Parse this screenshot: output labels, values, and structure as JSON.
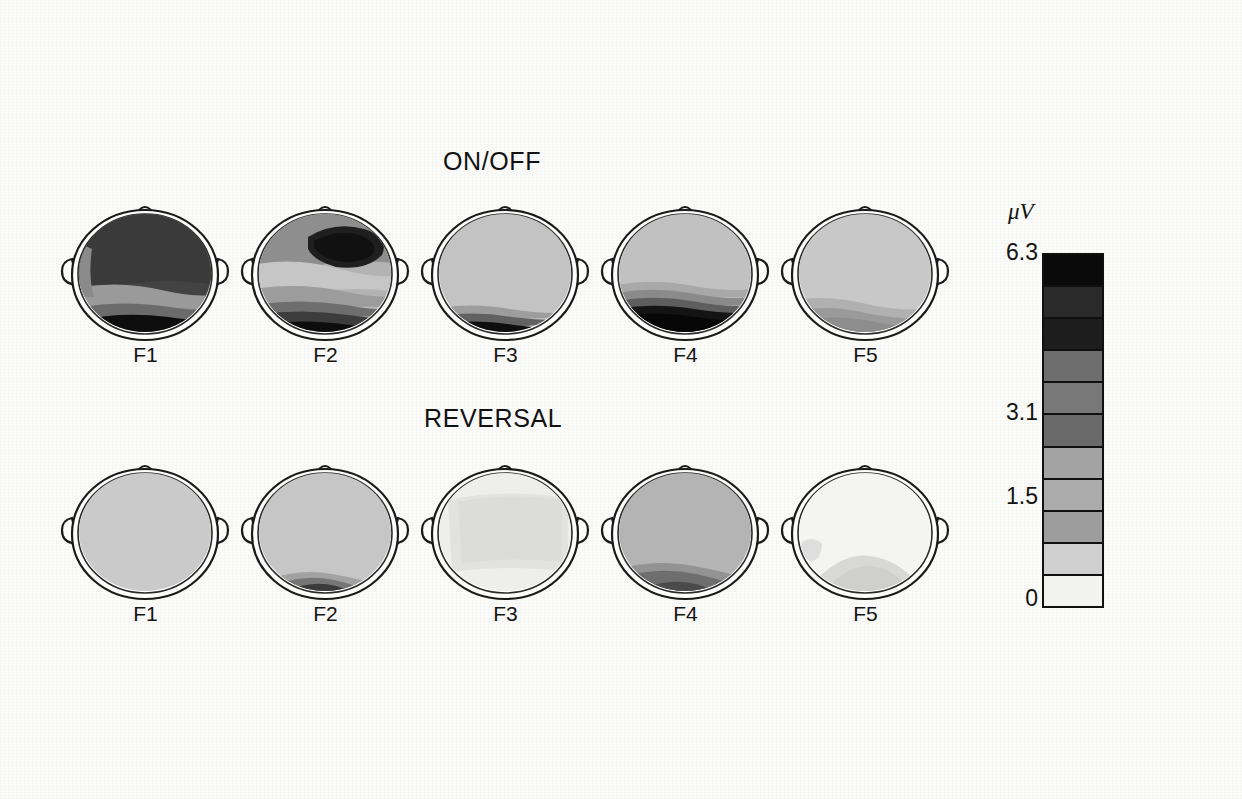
{
  "figure": {
    "background_color": "#fbfbfa",
    "row_titles": [
      {
        "id": "onoff",
        "label": "ON/OFF"
      },
      {
        "id": "reversal",
        "label": "REVERSAL"
      }
    ]
  },
  "colorbar": {
    "units_label": "μV",
    "ticks": [
      {
        "value": "6.3",
        "position_pct": 0
      },
      {
        "value": "3.1",
        "position_pct": 50
      },
      {
        "value": "1.5",
        "position_pct": 75
      },
      {
        "value": "0",
        "position_pct": 100
      }
    ],
    "max": 6.3,
    "min": 0,
    "band_count": 11,
    "band_colors": [
      "#0a0a0a",
      "#2a2a2a",
      "#1d1d1d",
      "#6e6e6e",
      "#787878",
      "#6a6a6a",
      "#a3a3a3",
      "#ababab",
      "#9d9d9d",
      "#cfcfcf",
      "#f2f2f0"
    ]
  },
  "chart_data": {
    "type": "heatmap",
    "subtitle": "ON/OFF and REVERSAL conditions, frequency components F1–F5",
    "units": "μV",
    "colorbar_ticks": [
      "6.3",
      "3.1",
      "1.5",
      "0"
    ],
    "value_range": [
      0,
      6.3
    ],
    "rows": [
      {
        "condition": "ON/OFF",
        "maps": [
          {
            "label": "F1",
            "description": "broad very-high amplitude over nearly entire scalp, darkest occipital band",
            "peak_uv": 6.3,
            "regions": [
              {
                "name": "frontal",
                "value": 5.2
              },
              {
                "name": "central",
                "value": 5.6
              },
              {
                "name": "parietal",
                "value": 4.4
              },
              {
                "name": "occipital",
                "value": 6.3
              },
              {
                "name": "left-temporal",
                "value": 2.6
              },
              {
                "name": "right-temporal",
                "value": 4.0
              }
            ]
          },
          {
            "label": "F2",
            "description": "focal dark maximum right-frontal, banded mid scalp, strong occipital band",
            "peak_uv": 6.3,
            "regions": [
              {
                "name": "frontal",
                "value": 3.0
              },
              {
                "name": "right-frontal-focus",
                "value": 6.0
              },
              {
                "name": "central",
                "value": 1.6
              },
              {
                "name": "parietal",
                "value": 2.4
              },
              {
                "name": "occipital",
                "value": 6.3
              },
              {
                "name": "left-temporal",
                "value": 1.4
              }
            ]
          },
          {
            "label": "F3",
            "description": "uniform low amplitude with narrow dark occipital rim",
            "peak_uv": 5.8,
            "regions": [
              {
                "name": "frontal",
                "value": 1.2
              },
              {
                "name": "central",
                "value": 1.2
              },
              {
                "name": "parietal",
                "value": 1.4
              },
              {
                "name": "occipital",
                "value": 5.8
              }
            ]
          },
          {
            "label": "F4",
            "description": "large graded occipital maximum extending to parietal",
            "peak_uv": 6.3,
            "regions": [
              {
                "name": "frontal",
                "value": 1.3
              },
              {
                "name": "central",
                "value": 1.4
              },
              {
                "name": "parietal",
                "value": 3.2
              },
              {
                "name": "occipital",
                "value": 6.3
              }
            ]
          },
          {
            "label": "F5",
            "description": "low amplitude overall with moderate occipital elevation",
            "peak_uv": 2.6,
            "regions": [
              {
                "name": "frontal",
                "value": 1.2
              },
              {
                "name": "central",
                "value": 1.3
              },
              {
                "name": "parietal",
                "value": 1.8
              },
              {
                "name": "occipital",
                "value": 2.6
              }
            ]
          }
        ]
      },
      {
        "condition": "REVERSAL",
        "maps": [
          {
            "label": "F1",
            "description": "flat uniform low amplitude across the scalp",
            "peak_uv": 1.4,
            "regions": [
              {
                "name": "frontal",
                "value": 1.3
              },
              {
                "name": "central",
                "value": 1.3
              },
              {
                "name": "parietal",
                "value": 1.3
              },
              {
                "name": "occipital",
                "value": 1.4
              }
            ]
          },
          {
            "label": "F2",
            "description": "low amplitude with small dark focus at occipital midline",
            "peak_uv": 4.6,
            "regions": [
              {
                "name": "frontal",
                "value": 1.3
              },
              {
                "name": "central",
                "value": 1.4
              },
              {
                "name": "parietal",
                "value": 1.6
              },
              {
                "name": "occipital-focus",
                "value": 4.6
              }
            ]
          },
          {
            "label": "F3",
            "description": "near-zero amplitude, faint light patch centrally",
            "peak_uv": 0.9,
            "regions": [
              {
                "name": "frontal",
                "value": 0.5
              },
              {
                "name": "central",
                "value": 0.8
              },
              {
                "name": "parietal",
                "value": 0.6
              },
              {
                "name": "occipital",
                "value": 0.5
              }
            ]
          },
          {
            "label": "F4",
            "description": "moderate background with darker occipital midline focus",
            "peak_uv": 4.2,
            "regions": [
              {
                "name": "frontal",
                "value": 1.7
              },
              {
                "name": "central",
                "value": 1.8
              },
              {
                "name": "parietal",
                "value": 2.2
              },
              {
                "name": "occipital-focus",
                "value": 4.2
              }
            ]
          },
          {
            "label": "F5",
            "description": "near-zero amplitude, faint occipital hump",
            "peak_uv": 1.1,
            "regions": [
              {
                "name": "frontal",
                "value": 0.3
              },
              {
                "name": "central",
                "value": 0.4
              },
              {
                "name": "parietal",
                "value": 0.7
              },
              {
                "name": "occipital",
                "value": 1.1
              }
            ]
          }
        ]
      }
    ]
  },
  "heads": {
    "onoff": [
      {
        "label": "F1",
        "x": 58,
        "y": 193
      },
      {
        "label": "F2",
        "x": 238,
        "y": 193
      },
      {
        "label": "F3",
        "x": 418,
        "y": 193
      },
      {
        "label": "F4",
        "x": 598,
        "y": 193
      },
      {
        "label": "F5",
        "x": 778,
        "y": 193
      }
    ],
    "reversal": [
      {
        "label": "F1",
        "x": 58,
        "y": 452
      },
      {
        "label": "F2",
        "x": 238,
        "y": 452
      },
      {
        "label": "F3",
        "x": 418,
        "y": 452
      },
      {
        "label": "F4",
        "x": 598,
        "y": 452
      },
      {
        "label": "F5",
        "x": 778,
        "y": 452
      }
    ]
  }
}
